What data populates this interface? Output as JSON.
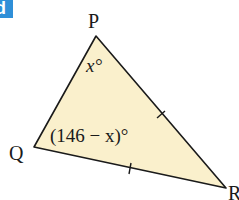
{
  "badge": {
    "label": "d",
    "color": "#2f8fd8"
  },
  "figure": {
    "type": "triangle",
    "fill": "#faf0cc",
    "stroke": "#1a1a1a",
    "vertices": {
      "P": {
        "label": "P"
      },
      "Q": {
        "label": "Q"
      },
      "R": {
        "label": "R"
      }
    },
    "angles": {
      "P": "x°",
      "Q": "(146 − x)°"
    },
    "equal_sides_marked": [
      "PR",
      "QR"
    ]
  }
}
